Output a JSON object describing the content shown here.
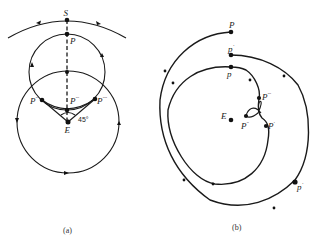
{
  "figure": {
    "panel_a": {
      "caption": "(a)",
      "labels": {
        "S": "S",
        "P": "P",
        "P_prime_left": "P",
        "P_prime_left_sup": "′′",
        "P_double_center": "P",
        "P_double_center_sup": "′′′",
        "P_prime_right": "P",
        "P_prime_right_sup": "′′′′",
        "E": "E",
        "angle": "45°"
      }
    },
    "panel_b": {
      "caption": "(b)",
      "labels": {
        "P": "P",
        "p_prime": "p",
        "p_prime_sup": "′",
        "p": "p",
        "P_triple": "P",
        "P_triple_sup": "′′′",
        "E": "E",
        "P_double": "P",
        "P_double_sup": "′′",
        "P_prime": "P",
        "P_prime_sup": "′",
        "p_lower": "p",
        "p_lower_sup": "′"
      }
    }
  }
}
